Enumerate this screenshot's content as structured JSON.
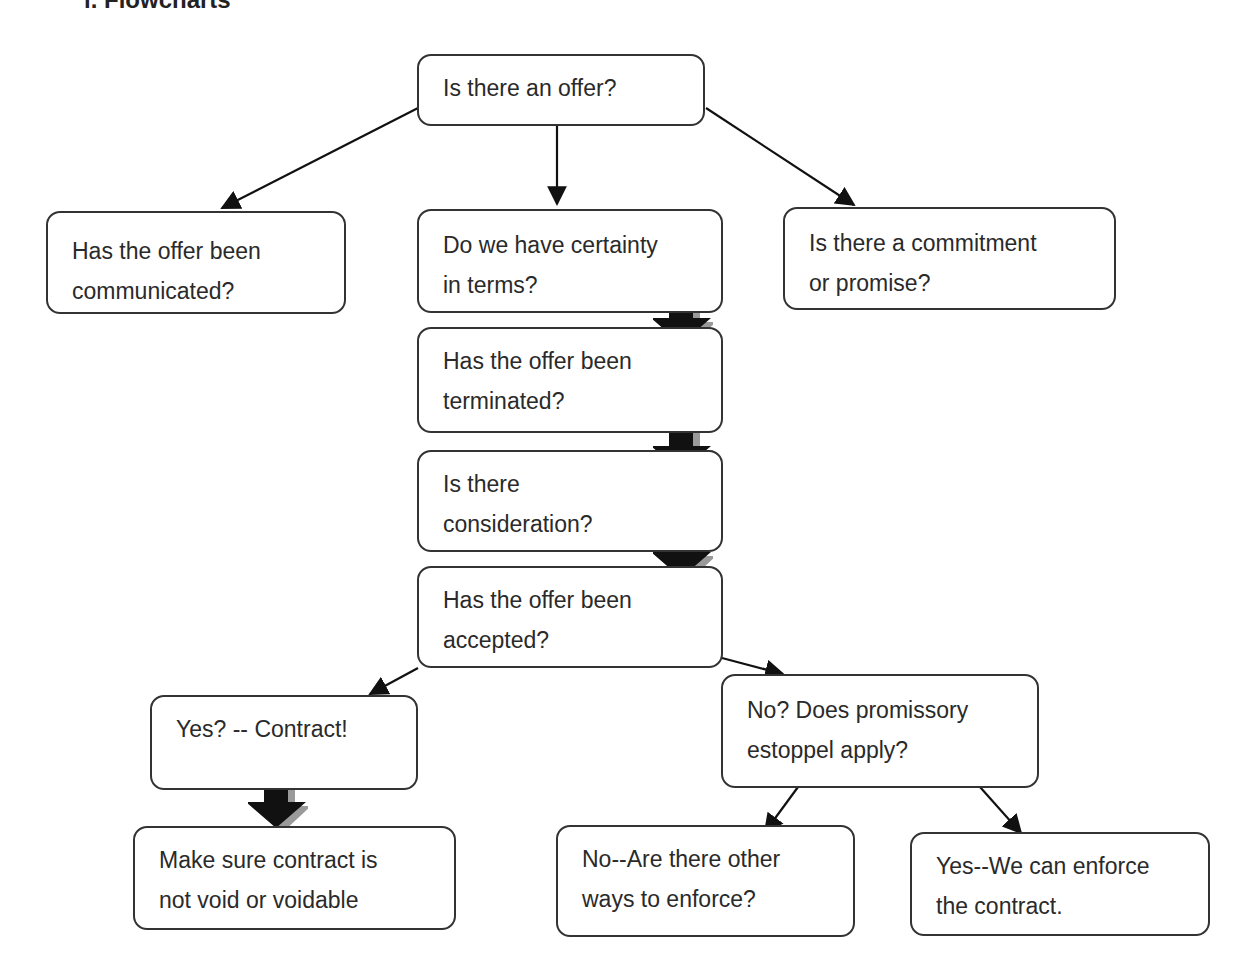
{
  "heading": "i. Flowcharts",
  "nodes": {
    "offer": {
      "lines": [
        "Is there an offer?"
      ]
    },
    "communicated": {
      "lines": [
        "Has the offer been",
        "communicated?"
      ]
    },
    "certainty": {
      "lines": [
        "Do we have certainty",
        "in terms?"
      ]
    },
    "commitment": {
      "lines": [
        "Is there a commitment",
        "or promise?"
      ]
    },
    "terminated": {
      "lines": [
        "Has the offer been",
        "terminated?"
      ]
    },
    "consideration": {
      "lines": [
        "Is there",
        "consideration?"
      ]
    },
    "accepted": {
      "lines": [
        "Has the offer been",
        "accepted?"
      ]
    },
    "contract": {
      "lines": [
        "Yes? -- Contract!"
      ]
    },
    "estoppel": {
      "lines": [
        "No? Does promissory",
        "estoppel apply?"
      ]
    },
    "void": {
      "lines": [
        "Make sure contract is",
        "not void or voidable"
      ]
    },
    "other_ways": {
      "lines": [
        "No--Are there other",
        "ways to enforce?"
      ]
    },
    "enforce": {
      "lines": [
        "Yes--We can enforce",
        "the contract."
      ]
    }
  },
  "colors": {
    "stroke": "#333333",
    "arrow_fill": "#111111",
    "arrow_shadow": "#9a9a9a",
    "text": "#2a2a2a"
  }
}
